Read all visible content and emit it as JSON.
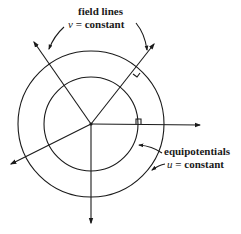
{
  "diagram": {
    "type": "field-lines-and-equipotentials",
    "center": [
      91,
      124
    ],
    "circles": [
      {
        "name": "inner-equipotential",
        "r": 47
      },
      {
        "name": "outer-equipotential",
        "r": 73
      }
    ],
    "field_lines": [
      {
        "name": "upper-left",
        "tip": [
          34,
          42
        ]
      },
      {
        "name": "upper-right",
        "tip": [
          154,
          44
        ]
      },
      {
        "name": "right",
        "tip": [
          200,
          125
        ]
      },
      {
        "name": "lower-left",
        "tip": [
          11,
          164
        ]
      },
      {
        "name": "down",
        "tip": [
          91,
          223
        ]
      }
    ],
    "right_angle_marks": [
      {
        "name": "outer-upper-right",
        "at": [
          137,
          70
        ]
      },
      {
        "name": "inner-right",
        "at": [
          138,
          124
        ]
      }
    ],
    "labels": {
      "field_lines_title": "field lines",
      "field_lines_var": "v",
      "field_lines_eq": " = constant",
      "equipotentials_title": "equipotentials",
      "equipotentials_var": "u",
      "equipotentials_eq": " = constant"
    },
    "colors": {
      "ink": "#1a1a1a",
      "background": "#ffffff"
    }
  }
}
